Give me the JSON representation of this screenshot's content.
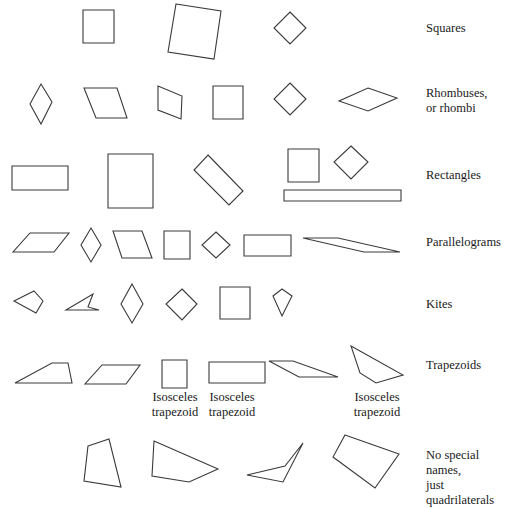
{
  "rows": [
    {
      "label": "Squares",
      "label_pos": [
        426,
        24
      ],
      "shapes": [
        {
          "points": "83,10 114,10 114,43 83,43"
        },
        {
          "points": "176,4 221,11 214,59 168,52"
        },
        {
          "points": "290,12 306,28 290,44 274,28"
        }
      ]
    },
    {
      "label": "Rhombuses,",
      "label2": "or rhombi",
      "label_pos": [
        426,
        89
      ],
      "shapes": [
        {
          "points": "41,84 52,102 41,124 30,104"
        },
        {
          "points": "84,88 117,88 127,118 96,118"
        },
        {
          "points": "158,86 182,96 181,119 158,110"
        },
        {
          "points": "213,86 243,86 243,119 213,119"
        },
        {
          "points": "290,83 306,99 290,115 274,99"
        },
        {
          "points": "368,88 397,98 368,111 339,101"
        }
      ]
    },
    {
      "label": "Rectangles",
      "label_pos": [
        426,
        168
      ],
      "shapes": [
        {
          "points": "12,166 68,166 68,190 12,190"
        },
        {
          "points": "108,154 153,154 153,208 108,208"
        },
        {
          "points": "208,155 243,191 229,205 194,170"
        },
        {
          "points": "288,149 319,149 319,182 288,182"
        },
        {
          "points": "351,146 368,162 351,179 334,162"
        },
        {
          "points": "284,190 401,190 401,201 284,201"
        }
      ]
    },
    {
      "label": "Parallelograms",
      "label_pos": [
        426,
        236
      ],
      "shapes": [
        {
          "points": "30,233 69,233 54,252 13,252"
        },
        {
          "points": "91,228 101,245 91,262 81,245"
        },
        {
          "points": "113,231 142,231 152,258 122,258"
        },
        {
          "points": "164,231 190,231 190,259 164,259"
        },
        {
          "points": "216,232 230,245 216,258 202,245"
        },
        {
          "points": "244,235 291,235 291,256 244,256"
        },
        {
          "points": "303,238 338,238 400,252 364,252"
        }
      ]
    },
    {
      "label": "Kites",
      "label_pos": [
        426,
        297
      ],
      "shapes": [
        {
          "points": "14,301 34,291 43,301 36,313"
        },
        {
          "points": "66,310 93,294 88,307 99,310"
        },
        {
          "points": "132,284 143,304 132,323 121,304"
        },
        {
          "points": "182,289 197,304 182,320 166,304"
        },
        {
          "points": "220,287 250,287 250,319 220,319"
        },
        {
          "points": "282,289 292,296 282,316 273,296"
        }
      ]
    },
    {
      "label": "Trapezoids",
      "label_pos": [
        426,
        358
      ],
      "shapes": [
        {
          "points": "15,383 52,363 68,363 72,383"
        },
        {
          "points": "102,365 140,365 126,384 85,384"
        },
        {
          "points": "162,360 187,360 187,388 162,388"
        },
        {
          "points": "209,362 265,362 265,383 209,383"
        },
        {
          "points": "269,361 293,361 338,377 299,377"
        },
        {
          "points": "351,346 403,375 376,383 360,373"
        }
      ],
      "sublabels": [
        {
          "lines": [
            "Isosceles",
            "trapezoid"
          ],
          "pos": [
            140,
            392
          ]
        },
        {
          "lines": [
            "Isosceles",
            "trapezoid"
          ],
          "pos": [
            197,
            392
          ]
        },
        {
          "lines": [
            "Isosceles",
            "trapezoid"
          ],
          "pos": [
            342,
            392
          ]
        }
      ]
    },
    {
      "label": "No special names,",
      "label2": "just quadrilaterals",
      "label_pos": [
        426,
        450
      ],
      "shapes": [
        {
          "points": "88,446 109,439 121,487 84,481"
        },
        {
          "points": "154,441 218,469 189,482 152,476"
        },
        {
          "points": "247,475 285,466 303,443 283,482"
        },
        {
          "points": "345,435 399,454 375,488 333,457"
        }
      ]
    }
  ],
  "labels": {
    "squares": "Squares",
    "rhombuses_1": "Rhombuses,",
    "rhombuses_2": "or rhombi",
    "rectangles": "Rectangles",
    "parallelograms": "Parallelograms",
    "kites": "Kites",
    "trapezoids": "Trapezoids",
    "isosceles_1": "Isosceles",
    "trapezoid_1": "trapezoid",
    "isosceles_2": "Isosceles",
    "trapezoid_2": "trapezoid",
    "isosceles_3": "Isosceles",
    "trapezoid_3": "trapezoid",
    "none_1": "No special names,",
    "none_2": "just quadrilaterals"
  }
}
